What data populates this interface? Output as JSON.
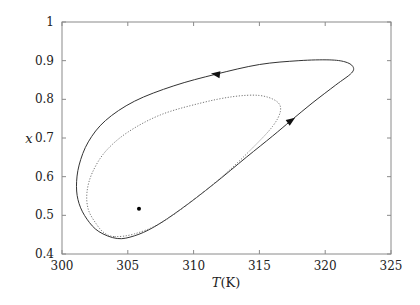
{
  "chart_data": {
    "type": "line",
    "title": "",
    "xlabel": "T(K)",
    "xlabel_italic_part": "T",
    "xlabel_unit": "(K)",
    "ylabel": "x",
    "xlim": [
      300,
      325
    ],
    "ylim": [
      0.4,
      1.0
    ],
    "xticks": [
      300,
      305,
      310,
      315,
      320,
      325
    ],
    "yticks": [
      0.4,
      0.5,
      0.6,
      0.7,
      0.8,
      0.9,
      1.0
    ],
    "xtick_labels": [
      "300",
      "305",
      "310",
      "315",
      "320",
      "325"
    ],
    "ytick_labels": [
      "0.4",
      "0.5",
      "0.6",
      "0.7",
      "0.8",
      "0.9",
      "1"
    ],
    "grid": false,
    "series": [
      {
        "name": "limit-cycle",
        "style": "solid",
        "closed": true,
        "points": [
          [
            304.2,
            0.44
          ],
          [
            305.5,
            0.447
          ],
          [
            307.0,
            0.47
          ],
          [
            309.0,
            0.515
          ],
          [
            311.5,
            0.58
          ],
          [
            314.0,
            0.65
          ],
          [
            316.0,
            0.705
          ],
          [
            317.4,
            0.745
          ],
          [
            319.0,
            0.79
          ],
          [
            320.8,
            0.837
          ],
          [
            322.0,
            0.868
          ],
          [
            322.1,
            0.885
          ],
          [
            321.5,
            0.897
          ],
          [
            320.3,
            0.902
          ],
          [
            318.0,
            0.9
          ],
          [
            315.0,
            0.89
          ],
          [
            311.7,
            0.865
          ],
          [
            308.5,
            0.835
          ],
          [
            305.5,
            0.795
          ],
          [
            303.3,
            0.745
          ],
          [
            302.0,
            0.69
          ],
          [
            301.3,
            0.63
          ],
          [
            301.1,
            0.575
          ],
          [
            301.3,
            0.53
          ],
          [
            301.9,
            0.49
          ],
          [
            302.8,
            0.458
          ],
          [
            304.2,
            0.44
          ]
        ],
        "arrows": [
          {
            "T": 311.7,
            "x": 0.865,
            "direction": "left"
          },
          {
            "T": 317.4,
            "x": 0.745,
            "direction": "up-right"
          }
        ]
      },
      {
        "name": "inner-trajectory",
        "style": "dotted",
        "closed": true,
        "points": [
          [
            304.0,
            0.445
          ],
          [
            305.5,
            0.452
          ],
          [
            307.5,
            0.48
          ],
          [
            310.0,
            0.54
          ],
          [
            312.5,
            0.61
          ],
          [
            314.5,
            0.675
          ],
          [
            316.0,
            0.73
          ],
          [
            316.6,
            0.77
          ],
          [
            316.3,
            0.795
          ],
          [
            315.0,
            0.81
          ],
          [
            313.0,
            0.807
          ],
          [
            310.5,
            0.79
          ],
          [
            307.5,
            0.76
          ],
          [
            305.0,
            0.715
          ],
          [
            303.3,
            0.665
          ],
          [
            302.3,
            0.61
          ],
          [
            301.9,
            0.56
          ],
          [
            302.0,
            0.515
          ],
          [
            302.6,
            0.478
          ],
          [
            303.2,
            0.455
          ],
          [
            304.0,
            0.445
          ]
        ]
      }
    ],
    "points": [
      {
        "name": "steady-state",
        "T": 305.85,
        "x": 0.517
      }
    ]
  }
}
